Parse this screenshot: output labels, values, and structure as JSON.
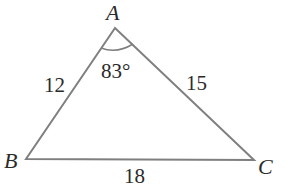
{
  "figure": {
    "type": "triangle",
    "vertices": [
      {
        "name": "A",
        "x": 115,
        "y": 28,
        "label_x": 106,
        "label_y": 20
      },
      {
        "name": "B",
        "x": 26,
        "y": 159,
        "label_x": 4,
        "label_y": 168
      },
      {
        "name": "C",
        "x": 254,
        "y": 160,
        "label_x": 258,
        "label_y": 174
      }
    ],
    "sides": [
      {
        "name": "AB",
        "label": "12",
        "x": 44,
        "y": 92
      },
      {
        "name": "AC",
        "label": "15",
        "x": 186,
        "y": 90
      },
      {
        "name": "BC",
        "label": "18",
        "x": 124,
        "y": 183
      }
    ],
    "angle": {
      "vertex": "A",
      "label": "83°",
      "x": 101,
      "y": 78
    },
    "stroke_color": "#7a7a7a",
    "text_color": "#2a2a2a"
  }
}
